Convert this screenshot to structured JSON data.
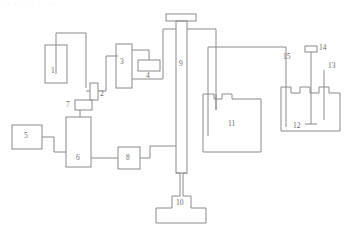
{
  "figure": {
    "kind": "process-flow-schematic",
    "background": "#ffffff",
    "stroke_color": "#8a8a8a",
    "label_color": "#6b6b6b",
    "stroke_width": 1,
    "top_artifact_text": "·· · ·· · ·· ··",
    "width": 350,
    "height": 230
  },
  "labels": [
    {
      "id": "1",
      "text": "1",
      "x": 51,
      "y": 67
    },
    {
      "id": "2",
      "text": "2",
      "x": 100,
      "y": 94
    },
    {
      "id": "3",
      "text": "3",
      "x": 120,
      "y": 62
    },
    {
      "id": "4",
      "text": "4",
      "x": 147,
      "y": 75
    },
    {
      "id": "5",
      "text": "5",
      "x": 26,
      "y": 136
    },
    {
      "id": "6",
      "text": "6",
      "x": 79,
      "y": 158
    },
    {
      "id": "7",
      "text": "7",
      "x": 68,
      "y": 109
    },
    {
      "id": "8",
      "text": "8",
      "x": 124,
      "y": 158
    },
    {
      "id": "9",
      "text": "9",
      "x": 183,
      "y": 65
    },
    {
      "id": "10",
      "text": "10",
      "x": 181,
      "y": 203
    },
    {
      "id": "11",
      "text": "11",
      "x": 230,
      "y": 124
    },
    {
      "id": "12",
      "text": "12",
      "x": 297,
      "y": 128
    },
    {
      "id": "13",
      "text": "13",
      "x": 330,
      "y": 67
    },
    {
      "id": "14",
      "text": "14",
      "x": 322,
      "y": 52
    },
    {
      "id": "15",
      "text": "15",
      "x": 286,
      "y": 58
    }
  ],
  "components": [
    {
      "id": "1",
      "name": "feed-vessel-1",
      "shape": "tank-with-dip-tube"
    },
    {
      "id": "2",
      "name": "valve-2",
      "shape": "small-vertical-box"
    },
    {
      "id": "3",
      "name": "unit-3",
      "shape": "tall-box"
    },
    {
      "id": "4",
      "name": "unit-4",
      "shape": "small-box"
    },
    {
      "id": "5",
      "name": "unit-5",
      "shape": "box"
    },
    {
      "id": "6",
      "name": "unit-6",
      "shape": "tall-box"
    },
    {
      "id": "7",
      "name": "gauge-7",
      "shape": "small-box-on-stem"
    },
    {
      "id": "8",
      "name": "unit-8",
      "shape": "box"
    },
    {
      "id": "9",
      "name": "column-9",
      "shape": "column-with-cap"
    },
    {
      "id": "10",
      "name": "base-vessel-10",
      "shape": "t-base"
    },
    {
      "id": "11",
      "name": "vessel-11",
      "shape": "notched-lid-vessel"
    },
    {
      "id": "12",
      "name": "vessel-12",
      "shape": "notched-lid-vessel"
    },
    {
      "id": "13",
      "name": "probe-13",
      "shape": "rod"
    },
    {
      "id": "14",
      "name": "probe-14",
      "shape": "rod-with-cap"
    },
    {
      "id": "15",
      "name": "probe-15",
      "shape": "rod"
    }
  ]
}
